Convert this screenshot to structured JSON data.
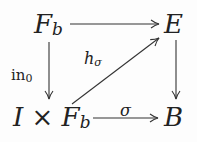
{
  "diagram": {
    "type": "commutative-square",
    "nodes": {
      "top_left": {
        "base": "F",
        "sub": "b"
      },
      "top_right": {
        "base": "E"
      },
      "bottom_left": {
        "pre": "I",
        "times": "×",
        "base": "F",
        "sub": "b"
      },
      "bottom_right": {
        "base": "B"
      }
    },
    "arrows": {
      "top": {
        "from": "F_b",
        "to": "E",
        "label": ""
      },
      "left": {
        "from": "F_b",
        "to": "I × F_b",
        "label_base": "in",
        "label_sub": "0"
      },
      "right": {
        "from": "E",
        "to": "B",
        "label": ""
      },
      "bottom": {
        "from": "I × F_b",
        "to": "B",
        "label": "σ"
      },
      "diagonal": {
        "from": "I × F_b",
        "to": "E",
        "label_base": "h",
        "label_sub": "σ"
      }
    },
    "stroke_color": "#333333"
  }
}
